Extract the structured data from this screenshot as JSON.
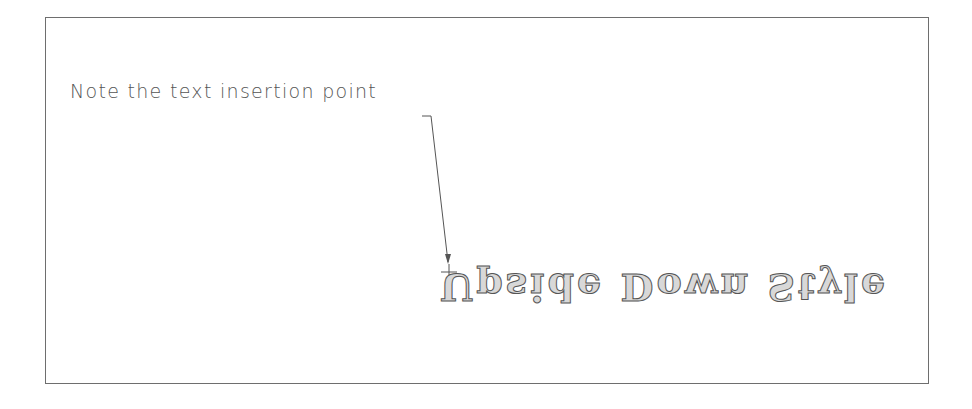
{
  "note": {
    "text": "Note the text insertion point"
  },
  "sample": {
    "text": "Upside Down Style",
    "orientation": "upside-down"
  },
  "colors": {
    "line": "#6e6e6e",
    "text": "#555555",
    "fill": "#d8d8d8"
  }
}
